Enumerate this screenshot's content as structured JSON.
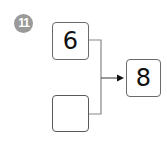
{
  "problem": {
    "number": "11",
    "badge_color": "#9a9a9a"
  },
  "diagram": {
    "inputs": [
      {
        "value": "6"
      },
      {
        "value": ""
      }
    ],
    "output": {
      "value": "8"
    },
    "connector_color": "#888888",
    "arrow_color": "#111111"
  }
}
